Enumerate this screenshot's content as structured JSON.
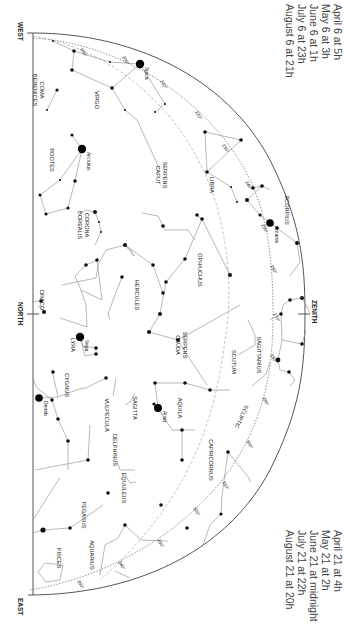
{
  "chart_title": "Star chart – southern sky, summer evening",
  "orientation": "rotated 90° clockwise",
  "directions": {
    "west": "WEST",
    "north": "NORTH",
    "east": "EAST",
    "zenith": "ZENITH"
  },
  "ecliptic_label": "ECLIPTIC",
  "times_top": [
    "April 6 at   5h",
    "May 6 at   3h",
    "June 6 at   1h",
    "July 6 at 23h",
    "August 6 at 21h"
  ],
  "times_bottom": [
    "April 21 at        4h",
    "May 21 at          2h",
    "June 21 at midnight",
    "July 21 at        22h",
    "August 21 at      20h"
  ],
  "constellations": [
    {
      "name": "COMA BERENICES",
      "x": 40,
      "y": 90
    },
    {
      "name": "VIRGO",
      "x": 95,
      "y": 100
    },
    {
      "name": "BOOTES",
      "x": 50,
      "y": 160
    },
    {
      "name": "SERPENS CAPUT",
      "x": 163,
      "y": 175
    },
    {
      "name": "LIBRA",
      "x": 210,
      "y": 185
    },
    {
      "name": "CORONA BOREALIS",
      "x": 85,
      "y": 225
    },
    {
      "name": "OPHIUCHUS",
      "x": 198,
      "y": 270
    },
    {
      "name": "SCORPIUS",
      "x": 285,
      "y": 210
    },
    {
      "name": "HERCULES",
      "x": 135,
      "y": 295
    },
    {
      "name": "DRACO",
      "x": 40,
      "y": 300
    },
    {
      "name": "SERPENS CAUDA",
      "x": 183,
      "y": 345
    },
    {
      "name": "SAGITTARIUS",
      "x": 257,
      "y": 355
    },
    {
      "name": "SCUTUM",
      "x": 232,
      "y": 362
    },
    {
      "name": "LYRA",
      "x": 71,
      "y": 345
    },
    {
      "name": "CYGNUS",
      "x": 65,
      "y": 385
    },
    {
      "name": "AQUILA",
      "x": 178,
      "y": 408
    },
    {
      "name": "VULPECULA",
      "x": 105,
      "y": 415
    },
    {
      "name": "SAGITTA",
      "x": 133,
      "y": 408
    },
    {
      "name": "DELPHINUS",
      "x": 113,
      "y": 450
    },
    {
      "name": "CAPRICORNUS",
      "x": 209,
      "y": 460
    },
    {
      "name": "EQUULEUS",
      "x": 122,
      "y": 488
    },
    {
      "name": "PEGASUS",
      "x": 82,
      "y": 515
    },
    {
      "name": "AQUARIUS",
      "x": 90,
      "y": 555
    },
    {
      "name": "PISCES",
      "x": 57,
      "y": 558
    }
  ],
  "stars": [
    {
      "name": "Spica",
      "x": 140,
      "y": 64,
      "r": 4.2
    },
    {
      "name": "Arcturus",
      "x": 82,
      "y": 149,
      "r": 4.2
    },
    {
      "name": "Antares",
      "x": 270,
      "y": 223,
      "r": 3.8
    },
    {
      "name": "Vega",
      "x": 80,
      "y": 337,
      "r": 4.2
    },
    {
      "name": "Deneb",
      "x": 39,
      "y": 398,
      "r": 3.8
    },
    {
      "name": "Altair",
      "x": 158,
      "y": 408,
      "r": 4.0
    }
  ],
  "ecliptic_degrees": [
    {
      "label": "190°",
      "x": 80,
      "y": 49
    },
    {
      "label": "200°",
      "x": 122,
      "y": 57
    },
    {
      "label": "210°",
      "x": 160,
      "y": 81
    },
    {
      "label": "220°",
      "x": 195,
      "y": 112
    },
    {
      "label": "230°",
      "x": 222,
      "y": 145
    },
    {
      "label": "240°",
      "x": 245,
      "y": 182
    },
    {
      "label": "250°",
      "x": 261,
      "y": 225
    },
    {
      "label": "260°",
      "x": 270,
      "y": 266
    },
    {
      "label": "270°",
      "x": 273,
      "y": 314
    },
    {
      "label": "280°",
      "x": 270,
      "y": 355
    },
    {
      "label": "290°",
      "x": 262,
      "y": 398
    },
    {
      "label": "300°",
      "x": 246,
      "y": 441
    },
    {
      "label": "310°",
      "x": 222,
      "y": 482
    },
    {
      "label": "320°",
      "x": 193,
      "y": 508
    },
    {
      "label": "330°",
      "x": 157,
      "y": 540
    },
    {
      "label": "340°",
      "x": 118,
      "y": 562
    },
    {
      "label": "350°",
      "x": 77,
      "y": 581
    }
  ]
}
